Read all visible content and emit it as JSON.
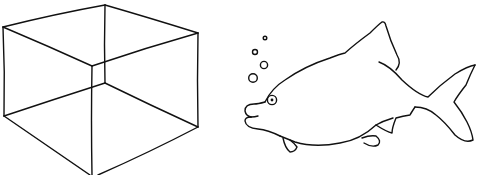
{
  "image": {
    "width": 477,
    "height": 175,
    "background": "#ffffff",
    "stroke_color": "#111111"
  },
  "drawings": [
    {
      "name": "wireframe-cube",
      "description": "Hand-drawn transparent wireframe cube"
    },
    {
      "name": "fish",
      "description": "Hand-drawn fish outline with bubbles rising from its mouth"
    }
  ],
  "fish": {
    "bubble_count": 4
  }
}
